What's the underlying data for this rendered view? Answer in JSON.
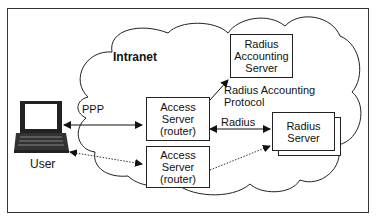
{
  "diagram": {
    "cloud_label": "Intranet",
    "user_label": "User",
    "nodes": {
      "access_server_1": {
        "lines": [
          "Access",
          "Server",
          "(router)"
        ]
      },
      "access_server_2": {
        "lines": [
          "Access",
          "Server",
          "(router)"
        ]
      },
      "radius_accounting_server": {
        "lines": [
          "Radius",
          "Accounting",
          "Server"
        ]
      },
      "radius_server": {
        "lines": [
          "Radius",
          "Server"
        ]
      }
    },
    "edges": [
      {
        "from": "user",
        "to": "access_server_1",
        "label": "PPP",
        "style": "solid",
        "arrows": "both"
      },
      {
        "from": "user",
        "to": "access_server_2",
        "label": "",
        "style": "dotted",
        "arrows": "both"
      },
      {
        "from": "access_server_1",
        "to": "radius_accounting_server",
        "label": "Radius Accounting Protocol",
        "style": "solid",
        "arrows": "end"
      },
      {
        "from": "access_server_1",
        "to": "radius_server",
        "label": "Radius",
        "style": "solid",
        "arrows": "both"
      },
      {
        "from": "access_server_2",
        "to": "radius_server",
        "label": "",
        "style": "dotted",
        "arrows": "end"
      }
    ],
    "labels": {
      "ppp": "PPP",
      "radius": "Radius",
      "accounting_line1": "Radius Accounting",
      "accounting_line2": "Protocol"
    }
  }
}
